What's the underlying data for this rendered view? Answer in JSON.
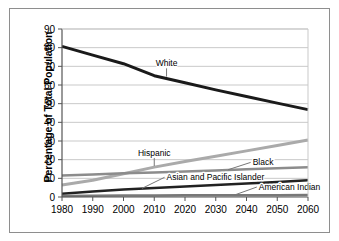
{
  "figure": {
    "frame_color": "#8e8e8e",
    "background": "#ffffff"
  },
  "chart_data": {
    "type": "line",
    "title": "",
    "subtitle": "",
    "xlabel": "",
    "ylabel": "Percentage of Total Population",
    "x": [
      1980,
      1990,
      2000,
      2010,
      2020,
      2030,
      2040,
      2050,
      2060
    ],
    "xticklabels": [
      "1980",
      "1990",
      "2000",
      "2010",
      "2020",
      "2030",
      "2040",
      "2050",
      "2060"
    ],
    "xlim": [
      1980,
      2060
    ],
    "ylim": [
      0,
      90
    ],
    "yticks": [
      0,
      10,
      20,
      30,
      40,
      50,
      60,
      70,
      80,
      90
    ],
    "yticklabels": [
      "0",
      "10",
      "20",
      "30",
      "40",
      "50",
      "60",
      "70",
      "80",
      "90"
    ],
    "grid": "horizontal",
    "legend": "none",
    "annotations": [
      {
        "label": "White",
        "x": 2014,
        "y": 70
      },
      {
        "label": "Hispanic",
        "x": 2010,
        "y": 22
      },
      {
        "label": "Black",
        "x": 2042,
        "y": 17
      },
      {
        "label": "Asian and Pacific Islander",
        "x": 2016,
        "y": 10
      },
      {
        "label": "American Indian",
        "x": 2046,
        "y": 4
      }
    ],
    "series": [
      {
        "name": "White",
        "color": "#1a1a1a",
        "width": 3.0,
        "values": [
          80.7,
          76.0,
          71.4,
          65.0,
          61.2,
          57.4,
          53.8,
          50.3,
          46.8
        ]
      },
      {
        "name": "Hispanic",
        "color": "#aaaaaa",
        "width": 3.0,
        "values": [
          6.4,
          9.0,
          12.5,
          16.0,
          19.0,
          21.8,
          24.7,
          27.6,
          30.5
        ]
      },
      {
        "name": "Black",
        "color": "#8c8c8c",
        "width": 2.5,
        "values": [
          11.5,
          12.1,
          12.7,
          13.1,
          13.6,
          14.2,
          14.8,
          15.4,
          16.0
        ]
      },
      {
        "name": "Asian and Pacific Islander",
        "color": "#222222",
        "width": 2.5,
        "values": [
          1.8,
          2.9,
          4.0,
          4.8,
          5.6,
          6.4,
          7.2,
          8.1,
          9.0
        ]
      },
      {
        "name": "American Indian",
        "color": "#787878",
        "width": 2.5,
        "values": [
          0.6,
          0.7,
          0.8,
          0.8,
          0.9,
          0.9,
          1.0,
          1.0,
          1.1
        ]
      }
    ]
  }
}
